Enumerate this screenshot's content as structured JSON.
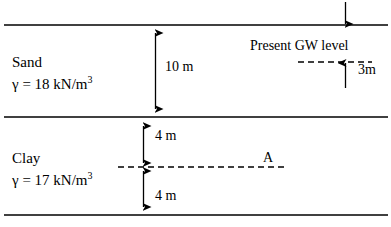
{
  "figure": {
    "type": "soil-profile-diagram",
    "width": 391,
    "height": 227,
    "line_color": "#000000",
    "background": "#ffffff"
  },
  "layers": [
    {
      "name": "Sand",
      "unit_weight_text": "γ = 18 kN/m",
      "unit_weight_exponent": "3",
      "unit_weight_value": 18,
      "unit_weight_units": "kN/m3",
      "thickness_label": "10 m",
      "thickness_value": 10
    },
    {
      "name": "Clay",
      "unit_weight_text": "γ = 17 kN/m",
      "unit_weight_exponent": "3",
      "unit_weight_value": 17,
      "unit_weight_units": "kN/m3",
      "upper_thickness_label": "4 m",
      "upper_thickness_value": 4,
      "lower_thickness_label": "4 m",
      "lower_thickness_value": 4
    }
  ],
  "groundwater": {
    "label": "Present GW level",
    "depth_label": "3m",
    "depth_value": 3,
    "depth_units": "m"
  },
  "point": {
    "label": "A",
    "depth_below_clay_top_m": 4
  }
}
